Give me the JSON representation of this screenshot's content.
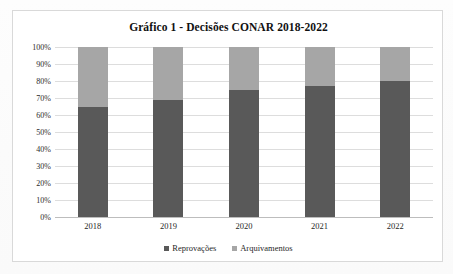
{
  "chart_data": {
    "type": "bar",
    "subtype": "100-percent-stacked-column",
    "title": "Gráfico 1 - Decisões CONAR 2018-2022",
    "xlabel": "",
    "ylabel": "",
    "categories": [
      "2018",
      "2019",
      "2020",
      "2021",
      "2022"
    ],
    "series": [
      {
        "name": "Reprovações",
        "color": "#595959",
        "values": [
          65,
          69,
          75,
          77,
          80
        ]
      },
      {
        "name": "Arquivamentos",
        "color": "#a6a6a6",
        "values": [
          35,
          31,
          25,
          23,
          20
        ]
      }
    ],
    "ylim": [
      0,
      100
    ],
    "ytick_step": 10,
    "ytick_labels": [
      "100%",
      "90%",
      "80%",
      "70%",
      "60%",
      "50%",
      "40%",
      "30%",
      "20%",
      "10%",
      "0%"
    ],
    "ytick_values": [
      100,
      90,
      80,
      70,
      60,
      50,
      40,
      30,
      20,
      10,
      0
    ],
    "grid": true,
    "legend_position": "bottom",
    "units": "percent"
  },
  "frame": {
    "border_color": "#d9d9d9"
  }
}
